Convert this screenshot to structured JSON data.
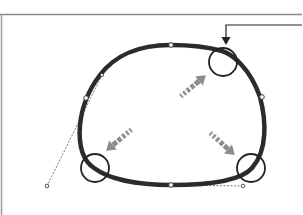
{
  "diagram": {
    "title": "",
    "description": "Closed path with anchor points and handles; three corner regions highlighted by circles, gray arrows and a callout arrow",
    "colors": {
      "background": "#ffffff",
      "path_stroke": "#2b2b2b",
      "frame_line": "#8a8a8a",
      "highlight_circle": "#222222",
      "direction_arrow": "#8c8c8c",
      "handle_line": "#555555",
      "anchor_fill": "#ffffff",
      "callout_arrow": "#222222"
    },
    "highlights": [
      {
        "id": "top-right",
        "label": ""
      },
      {
        "id": "bottom-left",
        "label": ""
      },
      {
        "id": "bottom-right",
        "label": ""
      }
    ],
    "arrows": [
      {
        "id": "to-top-right",
        "direction": "up-right"
      },
      {
        "id": "to-bottom-left",
        "direction": "down-left"
      },
      {
        "id": "to-bottom-right",
        "direction": "down-right"
      }
    ],
    "callout": {
      "target": "top-right",
      "direction": "down"
    }
  }
}
